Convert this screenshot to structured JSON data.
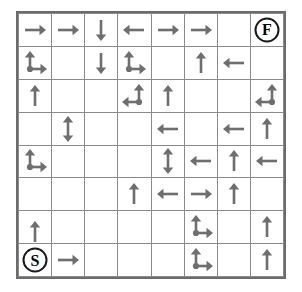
{
  "puzzle": {
    "title": "Arrow Maze Grid",
    "type": "arrow-maze",
    "rows": 8,
    "cols": 8,
    "arrow_color": "#6e6e6e",
    "grid_line_color": "#8a8a8a",
    "border_color": "#6b6b6b",
    "marker_color": "#1a1a1a",
    "background": "#ffffff",
    "start_label": "S",
    "finish_label": "F",
    "start_cell": {
      "row": 8,
      "col": 1
    },
    "finish_cell": {
      "row": 1,
      "col": 8
    },
    "legend": {
      "up": "up-arrow",
      "down": "down-arrow",
      "left": "left-arrow",
      "right": "right-arrow",
      "up-down": "up-down-double-arrow",
      "up-right": "up-right-branch-arrow",
      "up-left": "up-left-branch-arrow"
    },
    "cells": [
      [
        {
          "icon": "right"
        },
        {
          "icon": "right"
        },
        {
          "icon": "down"
        },
        {
          "icon": "left"
        },
        {
          "icon": "right"
        },
        {
          "icon": "right"
        },
        {
          "icon": ""
        },
        {
          "icon": "",
          "marker": "F"
        }
      ],
      [
        {
          "icon": "up-right"
        },
        {
          "icon": ""
        },
        {
          "icon": "down"
        },
        {
          "icon": "up-right"
        },
        {
          "icon": ""
        },
        {
          "icon": "up"
        },
        {
          "icon": "left"
        },
        {
          "icon": ""
        }
      ],
      [
        {
          "icon": "up"
        },
        {
          "icon": ""
        },
        {
          "icon": ""
        },
        {
          "icon": "up-left"
        },
        {
          "icon": "up"
        },
        {
          "icon": ""
        },
        {
          "icon": ""
        },
        {
          "icon": "up-left"
        }
      ],
      [
        {
          "icon": ""
        },
        {
          "icon": "up-down"
        },
        {
          "icon": ""
        },
        {
          "icon": ""
        },
        {
          "icon": "left"
        },
        {
          "icon": ""
        },
        {
          "icon": "left"
        },
        {
          "icon": "up"
        }
      ],
      [
        {
          "icon": "up-right"
        },
        {
          "icon": ""
        },
        {
          "icon": ""
        },
        {
          "icon": ""
        },
        {
          "icon": "up-down"
        },
        {
          "icon": "left"
        },
        {
          "icon": "up"
        },
        {
          "icon": "left"
        }
      ],
      [
        {
          "icon": ""
        },
        {
          "icon": ""
        },
        {
          "icon": ""
        },
        {
          "icon": "up"
        },
        {
          "icon": "left"
        },
        {
          "icon": "right"
        },
        {
          "icon": "up"
        },
        {
          "icon": ""
        }
      ],
      [
        {
          "icon": "up",
          "shift": "down"
        },
        {
          "icon": ""
        },
        {
          "icon": ""
        },
        {
          "icon": ""
        },
        {
          "icon": ""
        },
        {
          "icon": "up-right"
        },
        {
          "icon": ""
        },
        {
          "icon": "up"
        }
      ],
      [
        {
          "icon": "",
          "marker": "S"
        },
        {
          "icon": "right"
        },
        {
          "icon": ""
        },
        {
          "icon": ""
        },
        {
          "icon": ""
        },
        {
          "icon": "up-right"
        },
        {
          "icon": ""
        },
        {
          "icon": "up"
        }
      ]
    ]
  }
}
